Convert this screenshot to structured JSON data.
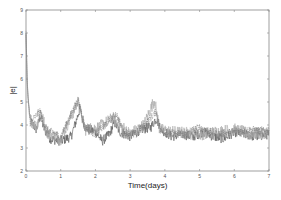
{
  "chart_data": {
    "type": "line",
    "title": "",
    "xlabel": "Time(days)",
    "ylabel": "|e|",
    "xlim": [
      0,
      7
    ],
    "ylim": [
      2,
      9
    ],
    "xticks": [
      0,
      1,
      2,
      3,
      4,
      5,
      6,
      7
    ],
    "yticks": [
      2,
      3,
      4,
      5,
      6,
      7,
      8,
      9
    ],
    "grid": false,
    "legend": null,
    "series": [
      {
        "name": "series-dark",
        "style": "solid",
        "color": "#555555",
        "keypoints": [
          [
            0,
            8.0
          ],
          [
            0.03,
            6.0
          ],
          [
            0.06,
            5.2
          ],
          [
            0.12,
            4.2
          ],
          [
            0.3,
            3.8
          ],
          [
            0.42,
            4.4
          ],
          [
            0.5,
            3.9
          ],
          [
            0.7,
            3.4
          ],
          [
            1.0,
            3.3
          ],
          [
            1.3,
            3.5
          ],
          [
            1.45,
            4.2
          ],
          [
            1.55,
            4.7
          ],
          [
            1.7,
            3.9
          ],
          [
            2.0,
            3.7
          ],
          [
            2.2,
            3.3
          ],
          [
            2.4,
            3.6
          ],
          [
            2.55,
            4.1
          ],
          [
            2.7,
            3.7
          ],
          [
            3.0,
            3.5
          ],
          [
            3.3,
            3.8
          ],
          [
            3.6,
            3.9
          ],
          [
            3.75,
            4.3
          ],
          [
            3.9,
            3.8
          ],
          [
            4.2,
            3.5
          ],
          [
            4.5,
            3.6
          ],
          [
            4.8,
            3.5
          ],
          [
            5.1,
            3.7
          ],
          [
            5.4,
            3.5
          ],
          [
            5.7,
            3.4
          ],
          [
            6.0,
            3.7
          ],
          [
            6.3,
            3.6
          ],
          [
            6.6,
            3.5
          ],
          [
            7.0,
            3.6
          ]
        ],
        "noise": 0.22
      },
      {
        "name": "series-light",
        "style": "solid",
        "color": "#aaaaaa",
        "keypoints": [
          [
            0,
            8.1
          ],
          [
            0.04,
            5.6
          ],
          [
            0.1,
            4.3
          ],
          [
            0.3,
            3.9
          ],
          [
            0.42,
            4.6
          ],
          [
            0.6,
            3.7
          ],
          [
            1.0,
            3.4
          ],
          [
            1.5,
            5.0
          ],
          [
            1.7,
            3.8
          ],
          [
            2.1,
            3.9
          ],
          [
            2.5,
            4.3
          ],
          [
            3.0,
            3.6
          ],
          [
            3.4,
            4.0
          ],
          [
            3.7,
            5.1
          ],
          [
            3.85,
            3.8
          ],
          [
            4.2,
            3.7
          ],
          [
            5.0,
            3.6
          ],
          [
            5.5,
            3.7
          ],
          [
            6.0,
            3.8
          ],
          [
            6.5,
            3.6
          ],
          [
            7.0,
            3.7
          ]
        ],
        "noise": 0.28
      },
      {
        "name": "series-dashed",
        "style": "dashed",
        "color": "#777777",
        "keypoints": [
          [
            0,
            7.9
          ],
          [
            0.05,
            5.4
          ],
          [
            0.12,
            4.1
          ],
          [
            0.4,
            4.6
          ],
          [
            0.6,
            3.8
          ],
          [
            1.0,
            3.5
          ],
          [
            1.5,
            5.1
          ],
          [
            1.7,
            3.9
          ],
          [
            2.0,
            3.6
          ],
          [
            2.6,
            4.5
          ],
          [
            2.8,
            3.7
          ],
          [
            3.2,
            3.6
          ],
          [
            3.75,
            4.6
          ],
          [
            3.9,
            3.7
          ],
          [
            4.5,
            3.6
          ],
          [
            5.0,
            3.9
          ],
          [
            5.5,
            3.6
          ],
          [
            6.0,
            3.7
          ],
          [
            6.5,
            3.8
          ],
          [
            7.0,
            3.7
          ]
        ],
        "noise": 0.18
      }
    ]
  },
  "plot": {
    "left": 26,
    "right": 269,
    "top": 10,
    "bottom": 171
  }
}
